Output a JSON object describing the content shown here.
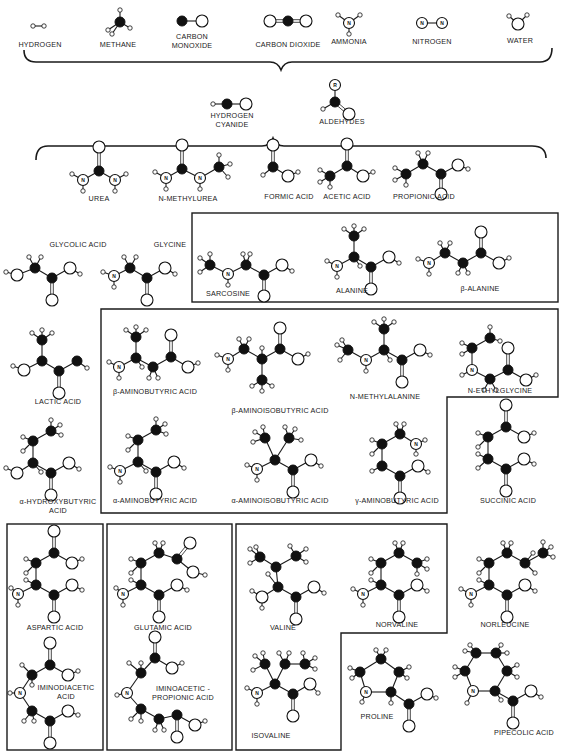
{
  "figure": {
    "legend_atoms": {
      "carbon": "filled black ball",
      "oxygen": "large open ball",
      "nitrogen": "open ball labeled N",
      "hydrogen": "small open ball",
      "r_group": "R"
    },
    "colors": {
      "ink": "#1a1a1a",
      "paper": "#ffffff"
    }
  },
  "row1": [
    {
      "id": "hydrogen",
      "label": "HYDROGEN",
      "x": 40,
      "y": 47
    },
    {
      "id": "methane",
      "label": "METHANE",
      "x": 118,
      "y": 47
    },
    {
      "id": "carbon_monoxide",
      "label": "CARBON\nMONOXIDE",
      "x": 192,
      "y": 39
    },
    {
      "id": "carbon_dioxide",
      "label": "CARBON DIOXIDE",
      "x": 288,
      "y": 47
    },
    {
      "id": "ammonia",
      "label": "AMMONIA",
      "x": 349,
      "y": 44
    },
    {
      "id": "nitrogen",
      "label": "NITROGEN",
      "x": 432,
      "y": 44
    },
    {
      "id": "water",
      "label": "WATER",
      "x": 520,
      "y": 43
    }
  ],
  "row2": [
    {
      "id": "hydrogen_cyanide",
      "label": "HYDROGEN\nCYANIDE",
      "x": 232,
      "y": 118
    },
    {
      "id": "aldehydes",
      "label": "ALDEHYDES",
      "x": 342,
      "y": 124
    },
    {
      "id": "r_group",
      "label": "R"
    }
  ],
  "row3": [
    {
      "id": "urea",
      "label": "UREA",
      "x": 99,
      "y": 201
    },
    {
      "id": "n_methylurea",
      "label": "N-METHYLUREA",
      "x": 188,
      "y": 201
    },
    {
      "id": "formic_acid",
      "label": "FORMIC ACID",
      "x": 289,
      "y": 199
    },
    {
      "id": "acetic_acid",
      "label": "ACETIC ACID",
      "x": 347,
      "y": 199
    },
    {
      "id": "propionic_acid",
      "label": "PROPIONIC ACID",
      "x": 424,
      "y": 199
    }
  ],
  "row4": [
    {
      "id": "glycolic_acid",
      "label": "GLYCOLIC ACID",
      "x": 78,
      "y": 247
    },
    {
      "id": "glycine",
      "label": "GLYCINE",
      "x": 170,
      "y": 247
    },
    {
      "id": "sarcosine",
      "label": "SARCOSINE",
      "x": 228,
      "y": 296
    },
    {
      "id": "alanine",
      "label": "ALANINE",
      "x": 352,
      "y": 293
    },
    {
      "id": "beta_alanine",
      "label": "β-ALANINE",
      "x": 480,
      "y": 291
    }
  ],
  "row5": [
    {
      "id": "lactic_acid",
      "label": "LACTIC ACID",
      "x": 58,
      "y": 404
    },
    {
      "id": "beta_aminobutyric_acid",
      "label": "β-AMINOBUTYRIC ACID",
      "x": 155,
      "y": 394
    },
    {
      "id": "beta_aminoisobutyric_acid",
      "label": "β-AMINOISOBUTYRIC ACID",
      "x": 280,
      "y": 413
    },
    {
      "id": "n_methylalanine",
      "label": "N-METHYLALANINE",
      "x": 385,
      "y": 399
    },
    {
      "id": "n_ethylglycine",
      "label": "N-ETHYLGLYCINE",
      "x": 500,
      "y": 393
    }
  ],
  "row6": [
    {
      "id": "alpha_hydroxybutyric_acid",
      "label": "α-HYDROXYBUTYRIC\nACID",
      "x": 58,
      "y": 504
    },
    {
      "id": "alpha_aminobutyric_acid",
      "label": "α-AMINOBUTYRIC ACID",
      "x": 155,
      "y": 503
    },
    {
      "id": "alpha_aminoisobutyric_acid",
      "label": "α-AMINOISOBUTYRIC ACID",
      "x": 280,
      "y": 503
    },
    {
      "id": "gamma_aminobutyric_acid",
      "label": "γ-AMINOBUTYRIC ACID",
      "x": 397,
      "y": 503
    },
    {
      "id": "succinic_acid",
      "label": "SUCCINIC ACID",
      "x": 508,
      "y": 503
    }
  ],
  "row7": [
    {
      "id": "aspartic_acid",
      "label": "ASPARTIC ACID",
      "x": 55,
      "y": 630
    },
    {
      "id": "glutamic_acid",
      "label": "GLUTAMIC ACID",
      "x": 163,
      "y": 630
    },
    {
      "id": "valine",
      "label": "VALINE",
      "x": 283,
      "y": 630
    },
    {
      "id": "norvaline",
      "label": "NORVALINE",
      "x": 397,
      "y": 627
    },
    {
      "id": "norleucine",
      "label": "NORLEUCINE",
      "x": 505,
      "y": 627
    }
  ],
  "row8": [
    {
      "id": "iminodiacetic_acid",
      "label": "IMINODIACETIC\nACID",
      "x": 66,
      "y": 690
    },
    {
      "id": "iminoacetic_propionic_acid",
      "label": "IMINOACETIC -\nPROPIONIC ACID",
      "x": 183,
      "y": 691
    },
    {
      "id": "isovaline",
      "label": "ISOVALINE",
      "x": 271,
      "y": 738
    },
    {
      "id": "proline",
      "label": "PROLINE",
      "x": 377,
      "y": 719
    },
    {
      "id": "pipecolic_acid",
      "label": "PIPECOLIC ACID",
      "x": 524,
      "y": 735
    }
  ],
  "nitrogen_label": "N"
}
